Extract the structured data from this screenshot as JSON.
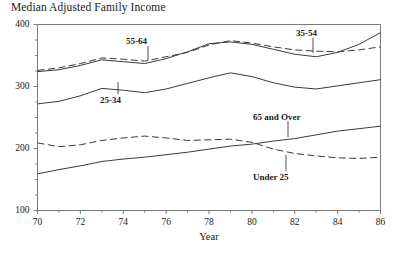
{
  "chart_data": {
    "type": "line",
    "title": "Median Adjusted Family Income",
    "xlabel": "Year",
    "ylabel": "",
    "xlim": [
      70,
      86
    ],
    "ylim": [
      100,
      400
    ],
    "xticks": [
      70,
      72,
      74,
      76,
      78,
      80,
      82,
      84,
      86
    ],
    "xticks_minor": [
      71,
      73,
      75,
      77,
      79,
      81,
      83,
      85
    ],
    "yticks": [
      100,
      200,
      300,
      400
    ],
    "yticks_minor": [
      125,
      150,
      175,
      225,
      250,
      275,
      325,
      350,
      375
    ],
    "grid": false,
    "legend_position": "inline-annotations",
    "x": [
      70,
      71,
      72,
      73,
      74,
      75,
      76,
      77,
      78,
      79,
      80,
      81,
      82,
      83,
      84,
      85,
      86
    ],
    "series": [
      {
        "name": "35-54",
        "style": "solid",
        "label": "35-54",
        "values": [
          324,
          327,
          334,
          343,
          340,
          337,
          345,
          356,
          369,
          372,
          368,
          360,
          352,
          348,
          355,
          368,
          387
        ]
      },
      {
        "name": "55-64",
        "style": "dashed",
        "label": "55-64",
        "values": [
          326,
          330,
          337,
          346,
          344,
          341,
          348,
          355,
          367,
          374,
          370,
          364,
          359,
          357,
          356,
          359,
          364
        ]
      },
      {
        "name": "25-34",
        "style": "solid",
        "label": "25-34",
        "values": [
          272,
          276,
          285,
          297,
          294,
          290,
          296,
          305,
          314,
          322,
          316,
          306,
          299,
          296,
          301,
          306,
          311
        ]
      },
      {
        "name": "65 and Over",
        "style": "solid",
        "label": "65 and Over",
        "values": [
          159,
          166,
          172,
          179,
          183,
          186,
          190,
          194,
          199,
          204,
          207,
          212,
          216,
          222,
          228,
          232,
          236
        ]
      },
      {
        "name": "Under 25",
        "style": "dashed",
        "label": "Under 25",
        "values": [
          209,
          203,
          206,
          213,
          217,
          220,
          217,
          213,
          214,
          215,
          210,
          199,
          192,
          188,
          185,
          184,
          186
        ]
      }
    ],
    "annotations": [
      {
        "text": "55-64",
        "target_series": "55-64",
        "target_year": 75
      },
      {
        "text": "25-34",
        "target_series": "25-34",
        "target_year": 75
      },
      {
        "text": "35-54",
        "target_series": "35-54",
        "target_year": 83
      },
      {
        "text": "65 and Over",
        "target_series": "65 and Over",
        "target_year": 83
      },
      {
        "text": "Under 25",
        "target_series": "Under 25",
        "target_year": 81
      }
    ]
  },
  "colors": {
    "line": "#3a3a3a",
    "axis": "#6b6b6b",
    "text": "#1a1a1a",
    "background": "#ffffff"
  }
}
